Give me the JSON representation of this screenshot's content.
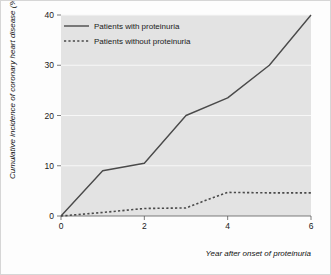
{
  "chart_data": {
    "type": "line",
    "title": "",
    "xlabel": "Year after onset of proteinuria",
    "ylabel": "Cumulative incidence of coronary heart disease (%)",
    "xlim": [
      0,
      6
    ],
    "ylim": [
      0,
      40
    ],
    "xticks": [
      "0",
      "2",
      "4",
      "6"
    ],
    "xtick_values": [
      0,
      2,
      4,
      6
    ],
    "yticks": [
      "0",
      "10",
      "20",
      "30",
      "40"
    ],
    "ytick_values": [
      0,
      10,
      20,
      30,
      40
    ],
    "grid": "horizontal",
    "legend_position": "top-left-inside",
    "plot_background": "#e3e3e3",
    "grid_color": "#f7f7f7",
    "line_color": "#4a4a4a",
    "series": [
      {
        "name": "Patients with proteinuria",
        "style": "solid",
        "x": [
          0,
          1,
          2,
          3,
          4,
          5,
          6
        ],
        "values": [
          0,
          9,
          10.5,
          20,
          23.5,
          30,
          40
        ]
      },
      {
        "name": "Patients without proteinuria",
        "style": "dashed",
        "x": [
          0,
          1,
          2,
          3,
          3.5,
          4,
          5,
          6
        ],
        "values": [
          0,
          0.7,
          1.5,
          1.6,
          3.2,
          4.7,
          4.6,
          4.6
        ]
      }
    ]
  },
  "legend": {
    "items": [
      {
        "label": "Patients with proteinuria",
        "style": "solid"
      },
      {
        "label": "Patients without proteinuria",
        "style": "dashed"
      }
    ]
  },
  "axes": {
    "y_title": "Cumulative incidence of coronary heart disease (%)",
    "x_title": "Year after onset of proteinuria",
    "y_tick_labels": [
      "40",
      "30",
      "20",
      "10",
      "0"
    ],
    "x_tick_labels": [
      "0",
      "2",
      "4",
      "6"
    ]
  }
}
